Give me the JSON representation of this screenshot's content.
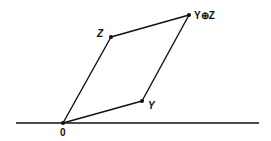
{
  "diagram": {
    "colors": {
      "stroke": "#111111",
      "background": "#ffffff"
    },
    "baseline": {
      "x1": 16,
      "y1": 123,
      "x2": 259,
      "y2": 123
    },
    "points": {
      "origin": {
        "label": "0",
        "x": 63,
        "y": 123,
        "lx": 60,
        "ly": 136
      },
      "y": {
        "label": "Y",
        "x": 142,
        "y": 101,
        "lx": 148,
        "ly": 109
      },
      "z": {
        "label": "Z",
        "x": 111,
        "y": 37,
        "lx": 97,
        "ly": 37
      },
      "sum": {
        "label": "Y⊕Z",
        "x": 189,
        "y": 15,
        "lx": 194,
        "ly": 19
      }
    },
    "edges": [
      [
        "origin",
        "y"
      ],
      [
        "origin",
        "z"
      ],
      [
        "z",
        "sum"
      ],
      [
        "y",
        "sum"
      ]
    ]
  }
}
